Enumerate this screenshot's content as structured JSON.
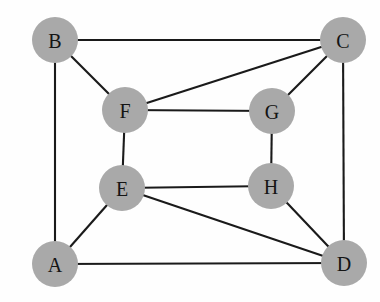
{
  "figure": {
    "background_color": "#fefefe",
    "width": 380,
    "height": 302
  },
  "style": {
    "node_fill_color": "#a9a9a9",
    "node_label_color": "#141414",
    "edge_color": "#1a1a1a",
    "edge_width": 2.1,
    "node_radius": 23
  },
  "graph_data": {
    "type": "node-link-diagram",
    "directed": false,
    "weighted": false,
    "node_count": 8,
    "edge_count": 14,
    "nodes": [
      {
        "id": "A",
        "label": "A",
        "x": 55,
        "y": 264,
        "degree": 3
      },
      {
        "id": "B",
        "label": "B",
        "x": 55,
        "y": 40,
        "degree": 3
      },
      {
        "id": "C",
        "label": "C",
        "x": 343,
        "y": 40,
        "degree": 4
      },
      {
        "id": "D",
        "label": "D",
        "x": 344,
        "y": 263,
        "degree": 4
      },
      {
        "id": "E",
        "label": "E",
        "x": 122,
        "y": 188,
        "degree": 4
      },
      {
        "id": "F",
        "label": "F",
        "x": 125,
        "y": 110,
        "degree": 4
      },
      {
        "id": "G",
        "label": "G",
        "x": 272,
        "y": 111,
        "degree": 3
      },
      {
        "id": "H",
        "label": "H",
        "x": 271,
        "y": 186,
        "degree": 3
      }
    ],
    "edges": [
      {
        "source": "B",
        "target": "C"
      },
      {
        "source": "B",
        "target": "A"
      },
      {
        "source": "B",
        "target": "F"
      },
      {
        "source": "C",
        "target": "D"
      },
      {
        "source": "C",
        "target": "F"
      },
      {
        "source": "C",
        "target": "G"
      },
      {
        "source": "F",
        "target": "G"
      },
      {
        "source": "F",
        "target": "E"
      },
      {
        "source": "G",
        "target": "H"
      },
      {
        "source": "E",
        "target": "H"
      },
      {
        "source": "E",
        "target": "A"
      },
      {
        "source": "E",
        "target": "D"
      },
      {
        "source": "H",
        "target": "D"
      },
      {
        "source": "A",
        "target": "D"
      }
    ]
  }
}
